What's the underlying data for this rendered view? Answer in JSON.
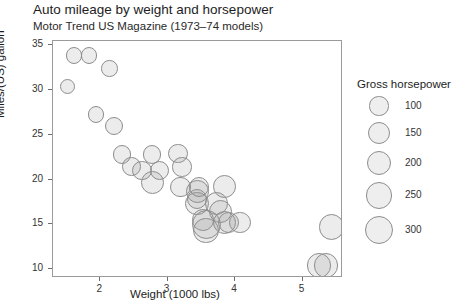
{
  "chart_data": {
    "type": "scatter",
    "title": "Auto mileage by weight and horsepower",
    "subtitle": "Motor Trend US Magazine (1973–74 models)",
    "xlabel": "Weight (1000 lbs)",
    "ylabel": "Miles/(US) gallon",
    "xlim": [
      1.3,
      5.6
    ],
    "ylim": [
      9.0,
      35.5
    ],
    "xticks": [
      "2",
      "3",
      "4",
      "5"
    ],
    "xtick_values": [
      2,
      3,
      4,
      5
    ],
    "yticks": [
      "10",
      "15",
      "20",
      "25",
      "30",
      "35"
    ],
    "ytick_values": [
      10,
      15,
      20,
      25,
      30,
      35
    ],
    "grid": false,
    "size_encoding": "Gross horsepower",
    "legend": {
      "position": "right",
      "title": "Gross horsepower",
      "entries": [
        "100",
        "150",
        "200",
        "250",
        "300"
      ],
      "values": [
        100,
        150,
        200,
        250,
        300
      ]
    },
    "points": [
      {
        "x": 1.513,
        "y": 30.4,
        "size": 52
      },
      {
        "x": 1.615,
        "y": 33.9,
        "size": 65
      },
      {
        "x": 1.835,
        "y": 33.9,
        "size": 66
      },
      {
        "x": 1.935,
        "y": 27.3,
        "size": 66
      },
      {
        "x": 2.14,
        "y": 32.4,
        "size": 66
      },
      {
        "x": 2.2,
        "y": 26.0,
        "size": 91
      },
      {
        "x": 2.32,
        "y": 22.8,
        "size": 93
      },
      {
        "x": 2.465,
        "y": 21.5,
        "size": 97
      },
      {
        "x": 2.62,
        "y": 21.0,
        "size": 110
      },
      {
        "x": 2.77,
        "y": 22.8,
        "size": 95
      },
      {
        "x": 2.78,
        "y": 19.7,
        "size": 175
      },
      {
        "x": 2.875,
        "y": 21.0,
        "size": 110
      },
      {
        "x": 3.15,
        "y": 22.9,
        "size": 113
      },
      {
        "x": 3.19,
        "y": 19.2,
        "size": 123
      },
      {
        "x": 3.215,
        "y": 21.4,
        "size": 109
      },
      {
        "x": 3.435,
        "y": 17.3,
        "size": 180
      },
      {
        "x": 3.44,
        "y": 18.7,
        "size": 175
      },
      {
        "x": 3.44,
        "y": 17.8,
        "size": 123
      },
      {
        "x": 3.46,
        "y": 19.2,
        "size": 123
      },
      {
        "x": 3.52,
        "y": 15.5,
        "size": 150
      },
      {
        "x": 3.57,
        "y": 14.3,
        "size": 245
      },
      {
        "x": 3.57,
        "y": 15.0,
        "size": 335
      },
      {
        "x": 3.73,
        "y": 17.3,
        "size": 180
      },
      {
        "x": 3.78,
        "y": 16.4,
        "size": 180
      },
      {
        "x": 3.84,
        "y": 15.2,
        "size": 180
      },
      {
        "x": 3.845,
        "y": 19.2,
        "size": 175
      },
      {
        "x": 3.9,
        "y": 15.2,
        "size": 150
      },
      {
        "x": 4.07,
        "y": 15.2,
        "size": 150
      },
      {
        "x": 5.25,
        "y": 10.4,
        "size": 205
      },
      {
        "x": 5.345,
        "y": 10.4,
        "size": 215
      },
      {
        "x": 5.424,
        "y": 14.7,
        "size": 230
      }
    ]
  }
}
